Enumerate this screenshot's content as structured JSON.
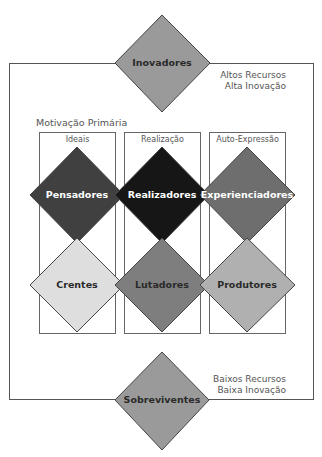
{
  "diagram": {
    "top_segment": {
      "label": "Inovadores",
      "fill": "#9a9a9a",
      "text_color": "#2a2a2a"
    },
    "bottom_segment": {
      "label": "Sobreviventes",
      "fill": "#9a9a9a",
      "text_color": "#2a2a2a"
    },
    "top_right_note": {
      "line1": "Altos Recursos",
      "line2": "Alta Inovação"
    },
    "bottom_right_note": {
      "line1": "Baixos Recursos",
      "line2": "Baixa Inovação"
    },
    "motivation_title": "Motivação Primária",
    "columns": [
      {
        "label": "Ideais",
        "upper": {
          "label": "Pensadores",
          "fill": "#404040",
          "text_color": "#ffffff"
        },
        "lower": {
          "label": "Crentes",
          "fill": "#dedede",
          "text_color": "#2a2a2a"
        }
      },
      {
        "label": "Realização",
        "upper": {
          "label": "Realizadores",
          "fill": "#161616",
          "text_color": "#ffffff"
        },
        "lower": {
          "label": "Lutadores",
          "fill": "#7e7e7e",
          "text_color": "#2a2a2a"
        }
      },
      {
        "label": "Auto-Expressão",
        "upper": {
          "label": "Experienciadores",
          "fill": "#6e6e6e",
          "text_color": "#ffffff"
        },
        "lower": {
          "label": "Produtores",
          "fill": "#b0b0b0",
          "text_color": "#2a2a2a"
        }
      }
    ],
    "stroke_color": "#444444"
  }
}
